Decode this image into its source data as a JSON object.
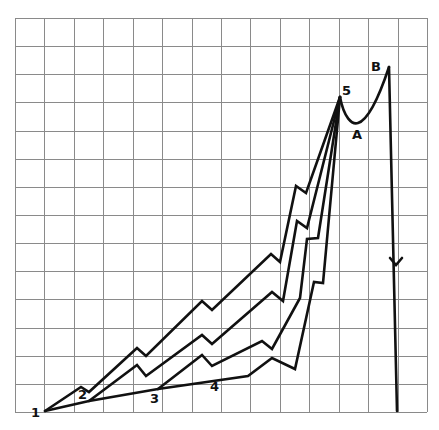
{
  "diagram": {
    "type": "grid-diagram",
    "grid": {
      "columns": 14,
      "rows": 14,
      "left": 15,
      "top": 18,
      "right": 427,
      "bottom": 412,
      "line_color": "#8a8a8a"
    },
    "stroke_color": "#111111",
    "labels": {
      "p1": "1",
      "p2": "2",
      "p3": "3",
      "p4": "4",
      "p5": "5",
      "pA": "A",
      "pB": "B"
    },
    "points": {
      "1": [
        45,
        411
      ],
      "2": [
        89,
        401
      ],
      "3": [
        158,
        389
      ],
      "4": [
        248,
        376
      ],
      "5": [
        340,
        97
      ],
      "A": [
        357,
        123
      ],
      "B": [
        389,
        67
      ]
    },
    "paths": [
      {
        "name": "path-1-to-5-upper",
        "points": [
          [
            45,
            411
          ],
          [
            81,
            387
          ],
          [
            89,
            392
          ],
          [
            137,
            348
          ],
          [
            146,
            356
          ],
          [
            202,
            301
          ],
          [
            212,
            310
          ],
          [
            271,
            254
          ],
          [
            280,
            262
          ],
          [
            296,
            186
          ],
          [
            306,
            193
          ],
          [
            340,
            97
          ]
        ]
      },
      {
        "name": "path-2-to-5",
        "points": [
          [
            89,
            401
          ],
          [
            137,
            365
          ],
          [
            146,
            376
          ],
          [
            202,
            335
          ],
          [
            212,
            344
          ],
          [
            272,
            292
          ],
          [
            283,
            301
          ],
          [
            297,
            221
          ],
          [
            307,
            228
          ],
          [
            340,
            97
          ]
        ]
      },
      {
        "name": "path-3-to-5",
        "points": [
          [
            158,
            389
          ],
          [
            202,
            355
          ],
          [
            212,
            366
          ],
          [
            262,
            341
          ],
          [
            272,
            349
          ],
          [
            300,
            298
          ],
          [
            307,
            239
          ],
          [
            318,
            238
          ],
          [
            340,
            97
          ]
        ]
      },
      {
        "name": "path-base-1-3-4-5",
        "points": [
          [
            45,
            411
          ],
          [
            89,
            401
          ],
          [
            158,
            389
          ],
          [
            248,
            376
          ],
          [
            272,
            358
          ],
          [
            295,
            369
          ],
          [
            314,
            282
          ],
          [
            323,
            283
          ],
          [
            340,
            97
          ]
        ]
      }
    ],
    "curve_5_A_B": "M340,97 C344,118 352,125 358,123 C368,120 378,100 389,67",
    "drop_line": {
      "from": [
        389,
        67
      ],
      "to": [
        397,
        411
      ],
      "arrow_at": [
        396,
        265
      ]
    }
  }
}
